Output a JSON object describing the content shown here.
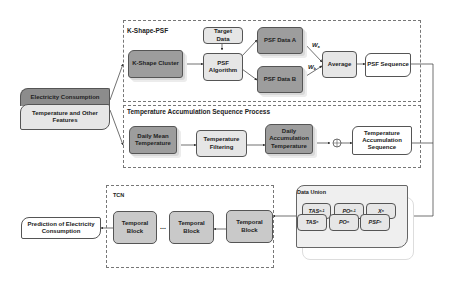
{
  "inputs": {
    "electricity": "Electricity Consumption",
    "temperature": "Temperature and Other Features"
  },
  "kshape": {
    "title": "K-Shape-PSF",
    "cluster": "K-Shape Cluster",
    "target_data": "Target Data",
    "psf_algorithm": "PSF Algorithm",
    "psf_data_a": "PSF Data A",
    "psf_data_b": "PSF Data B",
    "weight_a": "W",
    "weight_a_sub": "a",
    "weight_b": "W",
    "weight_b_sub": "b",
    "average": "Average",
    "psf_sequence": "PSF Sequence"
  },
  "temp_process": {
    "title": "Temperature Accumulation Sequence Process",
    "daily_mean": "Daily Mean Temperature",
    "filtering": "Temperature Filtering",
    "daily_accum": "Daily Accumulation Temperature",
    "sum_symbol": "⊕",
    "sequence": "Temperature Accumulation Sequence"
  },
  "data_union": {
    "title": "Data Union",
    "back_row": [
      {
        "base": "TAS",
        "sub": "n-1"
      },
      {
        "base": "PO",
        "sub": "n-1"
      },
      {
        "base": "X",
        "sub": "n"
      }
    ],
    "front_row": [
      {
        "base": "TAS",
        "sub": "n"
      },
      {
        "base": "PO",
        "sub": "n"
      },
      {
        "base": "PSF",
        "sub": "n"
      }
    ]
  },
  "tcn": {
    "title": "TCN",
    "block1": "Temporal Block",
    "ellipsis": "...",
    "block2": "Temporal Block",
    "block3": "Temporal Block"
  },
  "output": {
    "prediction": "Prediction of Electricity Consumption"
  },
  "colors": {
    "dark_node": "#9d9d9d",
    "light_node": "#e6e6e6",
    "tcn_block": "#c9c9c9",
    "border": "#555555"
  }
}
